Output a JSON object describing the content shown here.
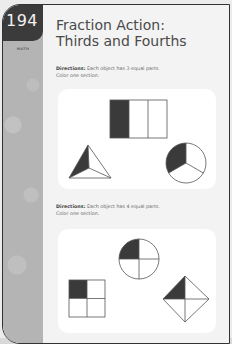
{
  "page": {
    "number": "194",
    "subject": "MATH",
    "title_line1": "Fraction Action:",
    "title_line2": "Thirds and Fourths"
  },
  "sections": [
    {
      "directions_label": "Directions:",
      "directions_text": " Each object has 3 equal parts.",
      "instruction": "Color one section.",
      "shapes": [
        {
          "type": "rectangle",
          "parts": 3,
          "shaded": 1
        },
        {
          "type": "triangle",
          "parts": 3,
          "shaded": 1
        },
        {
          "type": "circle",
          "parts": 3,
          "shaded": 1
        }
      ]
    },
    {
      "directions_label": "Directions:",
      "directions_text": " Each object has 4 equal parts.",
      "instruction": "Color one section.",
      "shapes": [
        {
          "type": "circle",
          "parts": 4,
          "shaded": 1
        },
        {
          "type": "square",
          "parts": 4,
          "shaded": 1
        },
        {
          "type": "diamond",
          "parts": 4,
          "shaded": 1
        }
      ]
    }
  ],
  "colors": {
    "shade": "#3a3a3a",
    "sidebar": "#b4b4b4",
    "page_number_bg": "#3b3b3b"
  }
}
